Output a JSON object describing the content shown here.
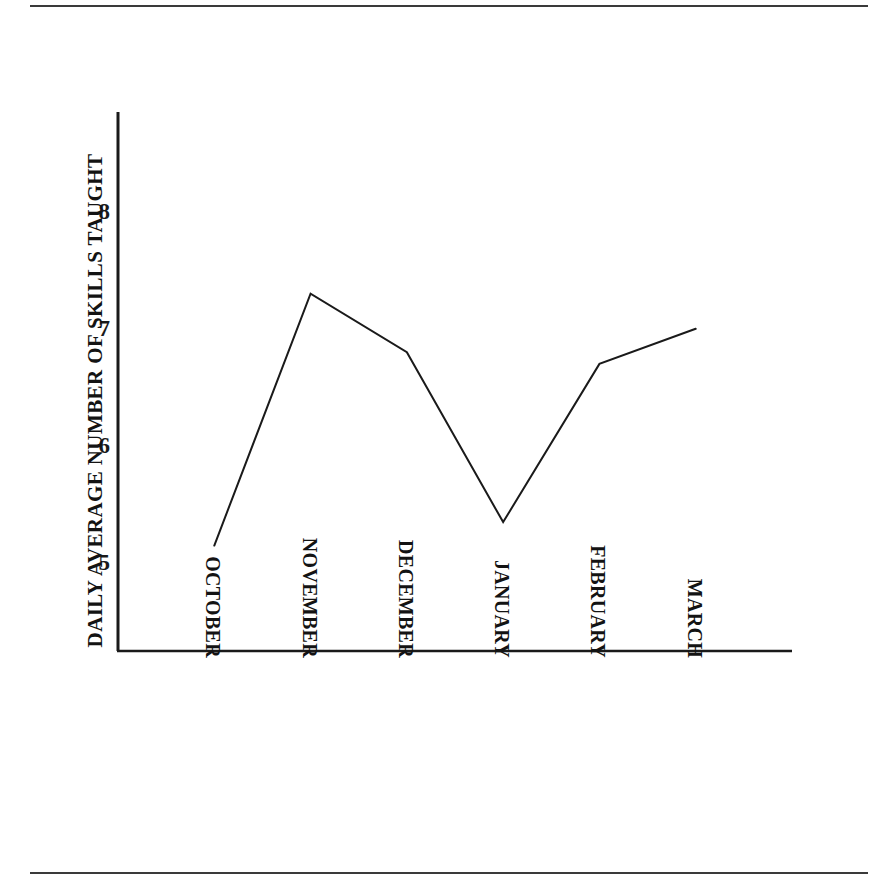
{
  "figure": {
    "background_color": "#ffffff",
    "ink_color": "#131313",
    "rule_color": "#3a3a3a"
  },
  "chart_data": {
    "type": "line",
    "title": "",
    "subtitle": "",
    "xlabel": "",
    "ylabel": "DAILY AVERAGE NUMBER OF SKILLS TAUGHT",
    "categories": [
      "OCTOBER",
      "NOVEMBER",
      "DECEMBER",
      "JANUARY",
      "FEBRUARY",
      "MARCH"
    ],
    "values": [
      5.15,
      7.3,
      6.8,
      5.35,
      6.7,
      7.0
    ],
    "series": [
      {
        "name": "Daily average number of skills taught",
        "values": [
          5.15,
          7.3,
          6.8,
          5.35,
          6.7,
          7.0
        ]
      }
    ],
    "ylim": [
      4.25,
      8.85
    ],
    "yticks": [
      5,
      6,
      7,
      8
    ],
    "ytick_labels": [
      "5",
      "6",
      "7",
      "8"
    ],
    "xlim": [
      0,
      7
    ],
    "grid": false,
    "legend": false,
    "legend_position": "none",
    "line_color": "#1a1a1a",
    "line_width": 2,
    "markers": false,
    "axis_spines": [
      "left",
      "bottom"
    ]
  },
  "axis": {
    "y_tick_8": "8",
    "y_tick_7": "7",
    "y_tick_6": "6",
    "y_tick_5": "5"
  },
  "x_labels": {
    "c0": "OCTOBER",
    "c1": "NOVEMBER",
    "c2": "DECEMBER",
    "c3": "JANUARY",
    "c4": "FEBRUARY",
    "c5": "MARCH"
  }
}
